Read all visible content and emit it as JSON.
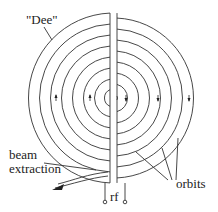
{
  "diagram": {
    "labels": {
      "dee": "\"Dee\"",
      "beam_line1": "beam",
      "beam_line2": "extraction",
      "orbits": "orbits",
      "rf": "rf"
    },
    "colors": {
      "line": "#333333",
      "text": "#222222",
      "background": "#ffffff"
    },
    "orbit_count": 8,
    "arrow_direction_left_dee": "up",
    "arrow_direction_right_dee": "down"
  }
}
